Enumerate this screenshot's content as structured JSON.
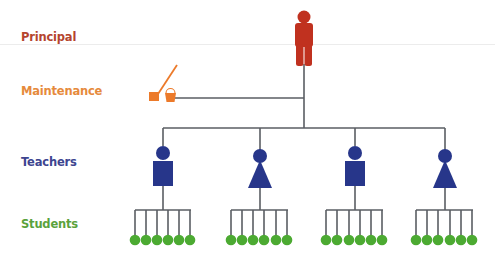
{
  "levels": [
    {
      "label": "Principal",
      "color": "#b5442e",
      "y": 40
    },
    {
      "label": "Maintenance",
      "color": "#e68a3c",
      "y": 94
    },
    {
      "label": "Teachers",
      "color": "#3d4590",
      "y": 165
    },
    {
      "label": "Students",
      "color": "#5aa23c",
      "y": 227
    }
  ],
  "colors": {
    "principal": "#c0311f",
    "maintenance": "#ec7a2a",
    "teacher": "#27368a",
    "student": "#4caa32",
    "line": "#555a60",
    "divider": "#e8e8e8"
  },
  "nodes": {
    "principal": {
      "icon": "person-icon",
      "count": 1
    },
    "maintenance": {
      "icon": "mop-bucket-icon",
      "count": 1
    },
    "teachers": [
      {
        "icon": "male-teacher-icon",
        "students": 6
      },
      {
        "icon": "female-teacher-icon",
        "students": 6
      },
      {
        "icon": "male-teacher-icon",
        "students": 6
      },
      {
        "icon": "female-teacher-icon",
        "students": 6
      }
    ]
  }
}
